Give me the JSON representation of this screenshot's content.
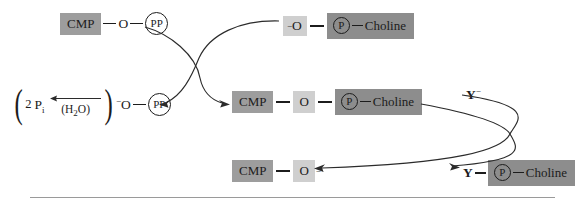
{
  "diagram": {
    "colors": {
      "chip_mid": "#9d9d9d",
      "chip_dark": "#8d8d8d",
      "chip_light": "#cfcfcf",
      "ink": "#1c1c1c",
      "rule": "#9a9a9a"
    },
    "top_row": {
      "cmp_label": "CMP",
      "bond1": "—",
      "oxygen": "O",
      "bond2": "—",
      "pp_label": "PP"
    },
    "top_right": {
      "charge": "−",
      "oxygen": "O",
      "bond": "—",
      "p_label": "P",
      "bond2": "—",
      "choline_label": "Choline"
    },
    "left_group": {
      "open_paren": "(",
      "count": "2",
      "pi_symbol": "P",
      "pi_subscript": "i",
      "water_label": "(H",
      "water_sub": "2",
      "water_tail": "O)",
      "close_paren": ")",
      "charge": "−",
      "oxygen": "O",
      "bond": "—",
      "pp_label": "PP"
    },
    "middle_row": {
      "cmp_label": "CMP",
      "bond1": "—",
      "oxygen": "O",
      "bond2": "—",
      "p_label": "P",
      "bond3": "—",
      "choline_label": "Choline"
    },
    "right_reactant": {
      "y_label": "Y",
      "charge": "−"
    },
    "bottom_left": {
      "cmp_label": "CMP",
      "bond": "—",
      "oxygen": "O",
      "charge": "−"
    },
    "bottom_right": {
      "y_label": "Y",
      "bond": "—",
      "p_label": "P",
      "bond2": "—",
      "choline_label": "Choline"
    }
  }
}
